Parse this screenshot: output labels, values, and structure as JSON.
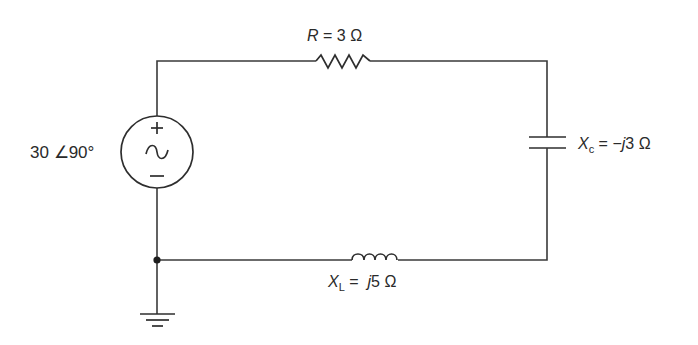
{
  "diagram": {
    "type": "ac-circuit-schematic",
    "source": {
      "label": "30 ∠90°",
      "magnitude": "30",
      "angle": "∠90°",
      "plus_symbol": "+",
      "minus_symbol": "−",
      "wave_symbol": "∼"
    },
    "resistor": {
      "symbol": "R",
      "equals": " = ",
      "value": "3 Ω"
    },
    "capacitor": {
      "symbol": "X",
      "subscript": "c",
      "equals": " = −",
      "j": "j",
      "value": "3 Ω"
    },
    "inductor": {
      "symbol": "X",
      "subscript": "L",
      "equals": " =  ",
      "j": "j",
      "value": "5 Ω"
    },
    "ground": {
      "symbol": "ground"
    },
    "colors": {
      "line": "#3a3a3a",
      "text": "#2a2a2a",
      "background": "#ffffff"
    }
  }
}
